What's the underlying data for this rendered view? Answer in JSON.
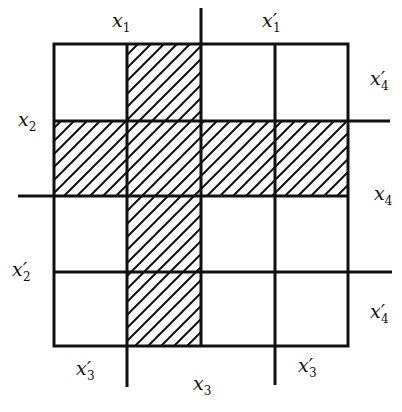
{
  "diagram": {
    "type": "karnaugh-map",
    "grid": {
      "rows": 4,
      "cols": 4
    },
    "colors": {
      "line": "#111111",
      "hatch": "#111111",
      "background": "#ffffff"
    },
    "hatched_cells": [
      [
        0,
        1
      ],
      [
        1,
        0
      ],
      [
        1,
        1
      ],
      [
        1,
        2
      ],
      [
        1,
        3
      ],
      [
        2,
        1
      ],
      [
        3,
        1
      ]
    ],
    "labels": {
      "top_left": {
        "var": "x",
        "sub": "1",
        "prime": ""
      },
      "top_right": {
        "var": "x",
        "sub": "1",
        "prime": "′"
      },
      "right_row0": {
        "var": "x",
        "sub": "4",
        "prime": "′"
      },
      "left_row1": {
        "var": "x",
        "sub": "2",
        "prime": ""
      },
      "right_row2": {
        "var": "x",
        "sub": "4",
        "prime": ""
      },
      "left_row3": {
        "var": "x",
        "sub": "2",
        "prime": "′"
      },
      "right_row3": {
        "var": "x",
        "sub": "4",
        "prime": "′"
      },
      "bottom_left": {
        "var": "x",
        "sub": "3",
        "prime": "′"
      },
      "bottom_mid": {
        "var": "x",
        "sub": "3",
        "prime": ""
      },
      "bottom_right": {
        "var": "x",
        "sub": "3",
        "prime": "′"
      }
    }
  }
}
